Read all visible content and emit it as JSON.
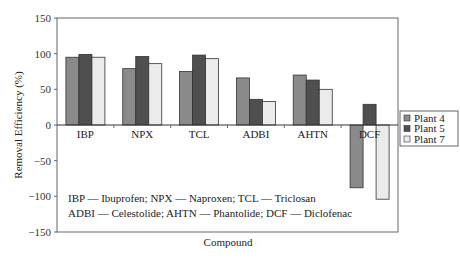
{
  "chart_data": {
    "type": "bar",
    "title": "",
    "xlabel": "Compound",
    "ylabel": "Removal Efficiency (%)",
    "ylim": [
      -150,
      150
    ],
    "yticks": [
      150,
      100,
      50,
      0,
      -50,
      -100,
      -150
    ],
    "grid": false,
    "legend_position": "right",
    "categories": [
      "IBP",
      "NPX",
      "TCL",
      "ADBI",
      "AHTN",
      "DCF"
    ],
    "series": [
      {
        "name": "Plant 4",
        "color": "#8a8a8a",
        "values": [
          95,
          79,
          75,
          66,
          70,
          -88
        ]
      },
      {
        "name": "Plant 5",
        "color": "#4f4f4f",
        "values": [
          99,
          96,
          98,
          36,
          63,
          29
        ]
      },
      {
        "name": "Plant 7",
        "color": "#ebebeb",
        "values": [
          95,
          86,
          93,
          33,
          50,
          -104
        ]
      }
    ],
    "annotations": [
      "IBP — Ibuprofen; NPX — Naproxen; TCL — Triclosan",
      "ADBI — Celestolide; AHTN — Phantolide; DCF — Diclofenac"
    ]
  }
}
